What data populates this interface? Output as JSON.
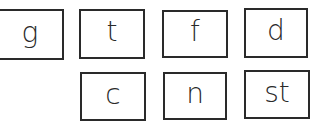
{
  "cards": [
    {
      "label": "g"
    },
    {
      "label": "t"
    },
    {
      "label": "f"
    },
    {
      "label": "d"
    },
    {
      "label": "c"
    },
    {
      "label": "n"
    },
    {
      "label": "st"
    }
  ],
  "colors": {
    "border": "#2a2a2a",
    "text": "#2a2a2a",
    "background": "#ffffff"
  }
}
